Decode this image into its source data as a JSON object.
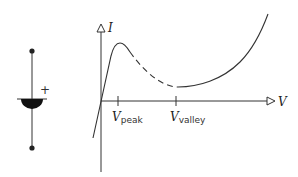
{
  "diagram": {
    "symbol": {
      "name": "tunnel diode",
      "polarity_label": "+"
    },
    "graph": {
      "y_axis_label": "I",
      "x_axis_label": "V",
      "ticks": [
        {
          "id": "peak",
          "main": "V",
          "subscript": "peak"
        },
        {
          "id": "valley",
          "main": "V",
          "subscript": "valley"
        }
      ],
      "curve_segments": [
        {
          "region": "rising to peak",
          "style": "solid"
        },
        {
          "region": "negative resistance (peak to valley)",
          "style": "dashed"
        },
        {
          "region": "rising after valley",
          "style": "solid"
        }
      ]
    },
    "colors": {
      "line": "#333333",
      "background": "#ffffff"
    }
  }
}
